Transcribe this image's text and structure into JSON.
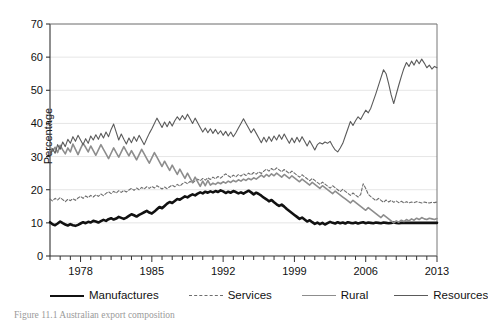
{
  "figure": {
    "caption": "Figure 11.1  Australian export composition"
  },
  "axes": {
    "ylabel": "Percentage",
    "yticks": [
      0,
      10,
      20,
      30,
      40,
      50,
      60,
      70
    ],
    "ylim": [
      0,
      70
    ],
    "xticks_labeled": [
      1978,
      1985,
      1992,
      1999,
      2006,
      2013
    ],
    "xlim": [
      1975,
      2013
    ],
    "grid": "horizontal-light-gray"
  },
  "legend": {
    "position": "below-axis",
    "items": [
      {
        "label": "Manufactures",
        "style": "thick-solid",
        "color": "#111111"
      },
      {
        "label": "Services",
        "style": "dashed",
        "color": "#6e6e6e"
      },
      {
        "label": "Rural",
        "style": "solid-medium",
        "color": "#8d8d8d"
      },
      {
        "label": "Resources",
        "style": "thin-solid",
        "color": "#5a5a5a"
      }
    ]
  },
  "chart_data": {
    "type": "line",
    "title": "",
    "xlabel": "",
    "ylabel": "Percentage",
    "ylim": [
      0,
      70
    ],
    "xlim": [
      1975,
      2013
    ],
    "x_start": 1975.0,
    "x_step": 0.25,
    "grid": true,
    "legend_position": "bottom",
    "series": [
      {
        "name": "Manufactures",
        "color": "#111111",
        "width": 2.6,
        "dash": "none",
        "values": [
          10.2,
          9.6,
          9.3,
          9.8,
          10.4,
          9.9,
          9.5,
          9.2,
          9.6,
          9.3,
          9.1,
          9.4,
          9.8,
          10.2,
          9.9,
          10.3,
          10.1,
          10.6,
          10.4,
          10.1,
          10.5,
          10.9,
          10.6,
          11.1,
          11.4,
          11.0,
          11.3,
          11.8,
          11.5,
          11.2,
          11.6,
          12.1,
          12.6,
          12.3,
          11.9,
          12.4,
          12.8,
          13.2,
          13.6,
          13.1,
          12.8,
          13.4,
          14.1,
          14.8,
          14.4,
          15.1,
          15.8,
          16.3,
          16.0,
          16.6,
          17.2,
          17.0,
          17.5,
          18.0,
          17.7,
          18.2,
          18.6,
          18.3,
          18.8,
          19.2,
          18.9,
          19.4,
          19.1,
          19.5,
          19.2,
          19.6,
          19.3,
          19.8,
          19.5,
          19.0,
          19.4,
          19.1,
          19.6,
          19.3,
          18.9,
          19.2,
          18.8,
          19.3,
          19.7,
          19.2,
          18.6,
          19.1,
          18.7,
          18.2,
          17.6,
          17.1,
          16.5,
          16.9,
          16.2,
          15.6,
          15.1,
          15.5,
          14.9,
          14.2,
          13.6,
          13.0,
          12.4,
          11.8,
          11.2,
          11.6,
          11.0,
          10.4,
          10.8,
          10.2,
          9.7,
          10.1,
          9.6,
          10.0,
          9.5,
          9.9,
          10.3,
          10.0,
          9.8,
          10.2,
          9.9,
          10.1,
          9.8,
          10.2,
          10.0,
          9.9,
          10.1,
          9.8,
          10.0,
          10.2,
          9.9,
          10.1,
          10.0,
          9.9,
          10.1,
          10.0,
          9.9,
          10.1,
          10.0,
          9.9,
          10.0,
          10.1,
          10.0,
          9.9,
          10.0,
          10.0,
          10.0,
          10.0,
          10.0,
          10.0,
          10.0,
          10.0,
          10.0,
          10.0,
          10.0,
          10.0,
          10.0,
          10.0,
          10.0
        ]
      },
      {
        "name": "Services",
        "color": "#6e6e6e",
        "width": 1.1,
        "dash": "3 2",
        "values": [
          17.2,
          16.6,
          17.4,
          16.9,
          17.6,
          17.0,
          16.4,
          17.1,
          16.7,
          17.3,
          16.8,
          17.5,
          18.0,
          17.4,
          18.1,
          17.6,
          18.3,
          17.8,
          18.5,
          18.0,
          18.7,
          18.2,
          18.9,
          19.4,
          18.8,
          19.5,
          19.0,
          19.7,
          19.2,
          19.8,
          19.3,
          19.9,
          20.4,
          19.8,
          20.5,
          20.0,
          20.7,
          20.2,
          20.9,
          20.4,
          21.0,
          20.5,
          21.2,
          20.7,
          20.2,
          20.8,
          20.3,
          20.9,
          21.4,
          20.9,
          21.6,
          21.1,
          21.8,
          22.3,
          21.8,
          22.5,
          22.0,
          22.7,
          23.2,
          22.7,
          23.4,
          22.9,
          23.6,
          23.1,
          23.8,
          23.3,
          24.0,
          23.5,
          24.2,
          24.8,
          24.2,
          23.7,
          24.4,
          23.9,
          24.6,
          24.1,
          24.8,
          24.3,
          25.0,
          24.5,
          25.2,
          24.7,
          25.4,
          24.9,
          25.6,
          26.2,
          25.6,
          26.4,
          25.8,
          26.6,
          26.0,
          25.4,
          26.1,
          25.5,
          24.9,
          25.6,
          25.0,
          24.4,
          23.8,
          24.5,
          23.9,
          23.3,
          22.7,
          23.4,
          22.8,
          22.2,
          21.6,
          22.3,
          21.7,
          21.1,
          20.5,
          21.2,
          20.6,
          20.0,
          19.4,
          20.1,
          19.5,
          18.9,
          18.3,
          19.0,
          18.4,
          17.8,
          18.5,
          21.8,
          20.4,
          18.6,
          17.9,
          17.3,
          16.7,
          17.4,
          16.8,
          16.2,
          16.9,
          16.3,
          16.8,
          16.2,
          16.6,
          16.1,
          16.5,
          16.0,
          16.4,
          16.0,
          16.3,
          16.1,
          16.4,
          16.2,
          16.0,
          16.3,
          16.1,
          16.0,
          16.2,
          16.1,
          16.3
        ]
      },
      {
        "name": "Rural",
        "color": "#8d8d8d",
        "width": 1.6,
        "dash": "none",
        "values": [
          33.0,
          31.6,
          32.8,
          31.2,
          33.4,
          32.0,
          30.8,
          32.6,
          31.4,
          33.8,
          32.2,
          30.6,
          32.4,
          34.0,
          32.8,
          31.4,
          33.2,
          31.8,
          30.4,
          32.0,
          33.6,
          32.2,
          30.8,
          29.4,
          31.0,
          32.6,
          31.2,
          29.8,
          31.4,
          33.0,
          31.6,
          30.2,
          31.8,
          30.4,
          29.0,
          30.6,
          32.2,
          30.8,
          29.4,
          28.0,
          29.6,
          31.2,
          29.8,
          28.4,
          27.0,
          28.6,
          27.2,
          25.8,
          27.4,
          26.0,
          24.6,
          26.2,
          24.8,
          23.4,
          25.0,
          23.6,
          22.2,
          23.8,
          22.4,
          21.0,
          22.6,
          21.2,
          22.8,
          21.4,
          22.0,
          21.6,
          22.2,
          21.8,
          22.4,
          22.0,
          22.6,
          22.2,
          22.8,
          22.4,
          23.0,
          22.6,
          23.2,
          22.8,
          23.4,
          23.0,
          23.6,
          23.2,
          23.8,
          24.4,
          23.8,
          24.6,
          24.0,
          24.8,
          24.2,
          25.0,
          24.4,
          23.8,
          24.6,
          24.0,
          23.4,
          24.2,
          23.6,
          23.0,
          22.4,
          23.2,
          22.6,
          22.0,
          21.4,
          22.2,
          21.6,
          21.0,
          20.4,
          21.2,
          20.6,
          20.0,
          19.4,
          18.8,
          19.6,
          19.0,
          18.4,
          17.8,
          17.2,
          16.6,
          16.0,
          16.8,
          16.2,
          15.6,
          15.0,
          14.4,
          13.8,
          14.6,
          14.0,
          13.4,
          12.8,
          12.2,
          11.6,
          12.4,
          11.8,
          11.2,
          10.6,
          10.0,
          10.6,
          10.2,
          10.8,
          10.4,
          11.0,
          10.6,
          11.2,
          10.8,
          11.4,
          11.0,
          11.6,
          11.2,
          11.0,
          11.4,
          11.2,
          11.0,
          11.3
        ]
      },
      {
        "name": "Resources",
        "color": "#5a5a5a",
        "width": 1.1,
        "dash": "none",
        "values": [
          30.2,
          32.4,
          31.0,
          33.6,
          32.2,
          34.4,
          33.0,
          35.2,
          34.0,
          36.0,
          34.6,
          36.4,
          35.0,
          33.6,
          35.4,
          34.0,
          36.2,
          35.0,
          36.6,
          35.2,
          37.0,
          35.6,
          37.4,
          36.0,
          38.2,
          39.8,
          37.4,
          35.0,
          36.8,
          35.2,
          33.8,
          35.6,
          34.2,
          36.0,
          34.6,
          36.4,
          35.0,
          33.6,
          35.4,
          37.0,
          38.4,
          40.0,
          41.6,
          40.2,
          38.8,
          40.4,
          39.0,
          40.6,
          39.2,
          40.8,
          42.0,
          41.0,
          42.4,
          41.2,
          42.8,
          41.4,
          40.0,
          41.6,
          40.2,
          38.8,
          37.4,
          38.6,
          37.2,
          38.4,
          37.0,
          38.2,
          36.8,
          37.8,
          36.4,
          37.6,
          36.2,
          37.4,
          36.0,
          37.2,
          38.6,
          40.0,
          41.4,
          40.0,
          38.6,
          37.2,
          38.4,
          37.0,
          35.6,
          34.2,
          35.8,
          34.4,
          36.0,
          34.6,
          36.2,
          35.0,
          36.6,
          35.2,
          36.8,
          35.4,
          34.0,
          35.6,
          34.2,
          35.8,
          34.4,
          36.0,
          34.6,
          33.2,
          34.8,
          33.4,
          32.0,
          33.6,
          34.2,
          33.8,
          34.4,
          34.0,
          34.6,
          33.2,
          32.0,
          31.4,
          32.6,
          34.0,
          36.2,
          38.4,
          40.6,
          39.4,
          40.8,
          42.0,
          41.2,
          42.6,
          44.0,
          43.2,
          44.6,
          46.8,
          49.0,
          51.4,
          53.8,
          56.2,
          55.0,
          52.0,
          48.6,
          46.0,
          48.8,
          51.6,
          54.2,
          56.6,
          58.4,
          57.2,
          58.8,
          57.6,
          59.2,
          58.0,
          59.4,
          58.2,
          56.8,
          57.6,
          56.4,
          57.2,
          56.8
        ]
      }
    ]
  }
}
